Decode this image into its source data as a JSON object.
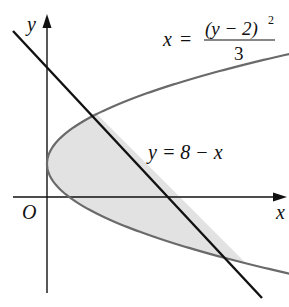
{
  "figure": {
    "axes": {
      "x_label": "x",
      "y_label": "y",
      "origin_label": "O"
    },
    "curves": [
      {
        "name": "parabola",
        "equation_lhs": "x",
        "equation_eq": "=",
        "equation_num": "(y − 2)",
        "equation_exp": "2",
        "equation_den": "3",
        "color": "#6a6a6a"
      },
      {
        "name": "line",
        "equation": "y = 8 − x",
        "color": "#111111"
      }
    ],
    "shaded_region": {
      "description": "Region bounded by the parabola and the line",
      "fill": "#e2e2e2"
    }
  },
  "chart_data": {
    "type": "line",
    "title": "",
    "xlabel": "x",
    "ylabel": "y",
    "series": [
      {
        "name": "x = (y − 2)^2 / 3",
        "points": [
          [
            0,
            2
          ],
          [
            1.333,
            0
          ],
          [
            3,
            5
          ],
          [
            12,
            -4
          ],
          [
            16.33,
            9
          ]
        ]
      },
      {
        "name": "y = 8 − x",
        "points": [
          [
            -2,
            10
          ],
          [
            0,
            8
          ],
          [
            3,
            5
          ],
          [
            8,
            0
          ],
          [
            12,
            -4
          ],
          [
            13,
            -5
          ]
        ]
      }
    ],
    "intersections": [
      [
        3,
        5
      ],
      [
        12,
        -4
      ]
    ],
    "annotations": [
      "O",
      "x = (y − 2)^2 / 3",
      "y = 8 − x"
    ],
    "grid": false
  }
}
